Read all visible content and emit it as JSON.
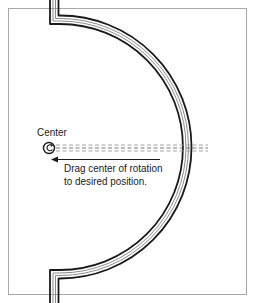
{
  "diagram": {
    "title": "",
    "labels": {
      "center": "Center",
      "instruction_line1": "Drag center of rotation",
      "instruction_line2": "to desired position."
    },
    "elements": {
      "wall": "curved-wall-semicircle",
      "center_marker": "rotate-icon",
      "axis": "dashed-reference-line",
      "arrow": "left-arrow"
    },
    "colors": {
      "frame": "#a8a8a8",
      "wall_outer": "#1a1a1a",
      "wall_inner": "#888888",
      "dash": "#9a9a9a",
      "text": "#1a1a1a",
      "background": "#ffffff"
    }
  }
}
